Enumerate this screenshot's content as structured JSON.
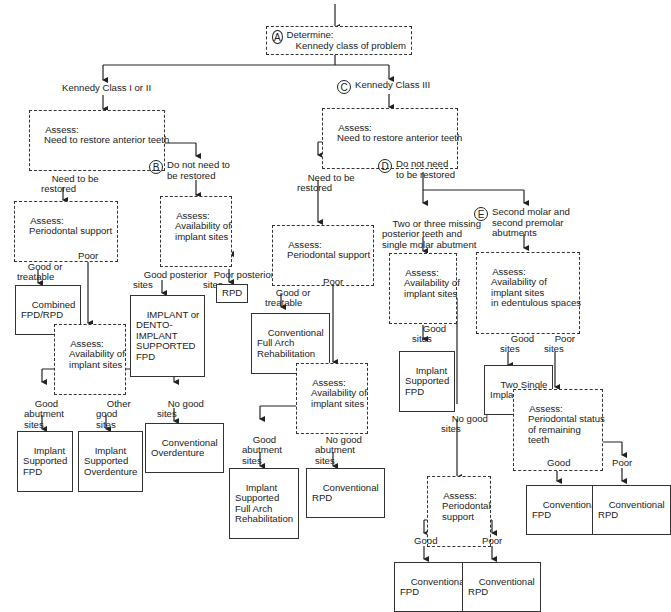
{
  "diagram": {
    "type": "decision-flowchart",
    "root": {
      "letter": "A",
      "line1": "Determine:",
      "line2": "Kennedy class of problem"
    },
    "left_branch": {
      "title": "Kennedy Class I or II",
      "assess": {
        "line1": "Assess:",
        "line2": "Need to restore anterior teeth"
      },
      "need": {
        "label_line1": "Need to be",
        "label_line2": "restored",
        "assess": {
          "line1": "Assess:",
          "line2": "Periodontal support"
        },
        "good": {
          "label_line1": "Good or",
          "label_line2": "treatable",
          "result_line1": "Combined",
          "result_line2": "FPD/RPD"
        },
        "poor": {
          "label": "Poor",
          "assess": {
            "line1": "Assess:",
            "line2": "Availability of",
            "line3": "implant sites"
          },
          "outcomes": [
            {
              "label_line1": "Good",
              "label_line2": "abutment",
              "label_line3": "sites",
              "result_line1": "Implant",
              "result_line2": "Supported",
              "result_line3": "FPD"
            },
            {
              "label_line1": "Other",
              "label_line2": "good",
              "label_line3": "sites",
              "result_line1": "Implant",
              "result_line2": "Supported",
              "result_line3": "Overdenture"
            },
            {
              "label_line1": "No good",
              "label_line2": "sites",
              "result_line1": "Conventional",
              "result_line2": "Overdenture"
            }
          ]
        }
      },
      "no_need": {
        "letter": "B",
        "label_line1": "Do not need to",
        "label_line2": "be restored",
        "assess": {
          "line1": "Assess:",
          "line2": "Availability of",
          "line3": "implant sites"
        },
        "good": {
          "label_line1": "Good posterior",
          "label_line2": "sites",
          "result_lines": [
            "IMPLANT or",
            "DENTO-",
            "IMPLANT",
            "SUPPORTED",
            "FPD"
          ]
        },
        "poor": {
          "label_line1": "Poor posterior",
          "label_line2": "sites",
          "result": "RPD"
        }
      }
    },
    "right_branch": {
      "letter": "C",
      "title": "Kennedy Class III",
      "assess": {
        "line1": "Assess:",
        "line2": "Need to restore anterior teeth"
      },
      "need": {
        "label_line1": "Need to be",
        "label_line2": "restored",
        "assess": {
          "line1": "Assess:",
          "line2": "Periodontal support"
        },
        "good": {
          "label_line1": "Good or",
          "label_line2": "treatable",
          "result_line1": "Conventional",
          "result_line2": "Full Arch",
          "result_line3": "Rehabilitation"
        },
        "poor": {
          "label": "Poor",
          "assess": {
            "line1": "Assess:",
            "line2": "Availability of",
            "line3": "implant sites"
          },
          "good": {
            "label_line1": "Good",
            "label_line2": "abutment",
            "label_line3": "sites",
            "result_lines": [
              "Implant",
              "Supported",
              "Full Arch",
              "Rehabilitation"
            ]
          },
          "none": {
            "label_line1": "No good",
            "label_line2": "abutment",
            "label_line3": "sites",
            "result_line1": "Conventional",
            "result_line2": "RPD"
          }
        }
      },
      "no_need": {
        "letter": "D",
        "label_line1": "Do not need",
        "label_line2": "to be restored",
        "two_three": {
          "label_line1": "Two or three missing",
          "label_line2": "posterior teeth and",
          "label_line3": "single molar abutment",
          "assess": {
            "line1": "Assess:",
            "line2": "Availability of",
            "line3": "implant sites"
          },
          "good": {
            "label_line1": "Good",
            "label_line2": "sites",
            "result_line1": "Implant",
            "result_line2": "Supported",
            "result_line3": "FPD"
          },
          "none": {
            "label_line1": "No good",
            "label_line2": "sites",
            "assess": {
              "line1": "Assess:",
              "line2": "Periodontal",
              "line3": "support"
            },
            "good": {
              "label": "Good",
              "result_line1": "Conventional",
              "result_line2": "FPD"
            },
            "poor": {
              "label": "Poor",
              "result_line1": "Conventional",
              "result_line2": "RPD"
            }
          }
        },
        "second_molar": {
          "letter": "E",
          "label_line1": "Second molar and",
          "label_line2": "second premolar",
          "label_line3": "abutments",
          "assess": {
            "line1": "Assess:",
            "line2": "Availability of",
            "line3": "implant sites",
            "line4": "in edentulous spaces"
          },
          "good": {
            "label_line1": "Good",
            "label_line2": "sites",
            "result_line1": "Two Single",
            "result_line2": "Implants"
          },
          "poor": {
            "label_line1": "Poor",
            "label_line2": "sites",
            "assess": {
              "line1": "Assess:",
              "line2": "Periodontal status",
              "line3": "of remaining",
              "line4": "teeth"
            },
            "good": {
              "label": "Good",
              "result_line1": "Conventional",
              "result_line2": "FPD"
            },
            "poor": {
              "label": "Poor",
              "result_line1": "Conventional",
              "result_line2": "RPD"
            }
          }
        }
      }
    }
  }
}
